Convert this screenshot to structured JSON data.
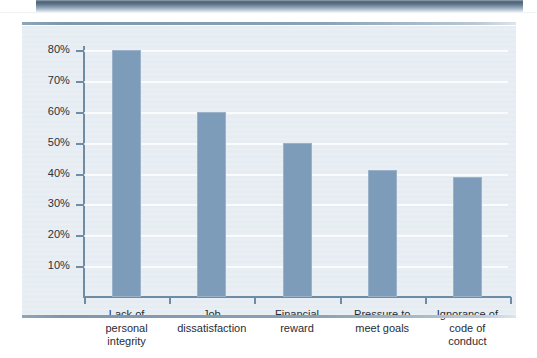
{
  "figure": {
    "panel_bg": "#e6edf2",
    "bar_color": "#7d9cba",
    "axis_color": "#6f8ca5",
    "rule_color": "#8aa2b5"
  },
  "chart_data": {
    "type": "bar",
    "title": "",
    "subtitle": "",
    "xlabel": "",
    "ylabel": "",
    "ylim": [
      0,
      85
    ],
    "grid": true,
    "legend": "none",
    "categories": [
      "Lack of personal integrity",
      "Job dissatisfaction",
      "Financial reward",
      "Pressure to meet goals",
      "Ignorance of code of conduct"
    ],
    "category_lines": [
      [
        "Lack of",
        "personal",
        "integrity"
      ],
      [
        "Job",
        "dissatisfaction"
      ],
      [
        "Financial",
        "reward"
      ],
      [
        "Pressure to",
        "meet goals"
      ],
      [
        "Ignorance of",
        "code of",
        "conduct"
      ]
    ],
    "values": [
      80,
      60,
      50,
      41,
      39
    ],
    "value_labels": [
      "80%",
      "60%",
      "50%",
      "41%",
      "39%"
    ],
    "yticks": [
      10,
      20,
      30,
      40,
      50,
      60,
      70,
      80
    ],
    "ytick_labels": [
      "10%",
      "20%",
      "30%",
      "40%",
      "50%",
      "60%",
      "70%",
      "80%"
    ]
  }
}
